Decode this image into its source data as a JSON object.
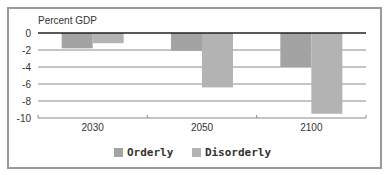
{
  "chart_data": {
    "type": "bar",
    "title": "",
    "ylabel": "Percent GDP",
    "xlabel": "",
    "categories": [
      "2030",
      "2050",
      "2100"
    ],
    "series": [
      {
        "name": "Orderly",
        "values": [
          -1.8,
          -2.1,
          -4.0
        ],
        "color": "#a3a3a3"
      },
      {
        "name": "Disorderly",
        "values": [
          -1.2,
          -6.4,
          -9.5
        ],
        "color": "#b3b3b3"
      }
    ],
    "ylim": [
      -10,
      0
    ],
    "yticks": [
      "0",
      "-2",
      "-4",
      "-6",
      "-8",
      "-10"
    ],
    "grid": true,
    "legend_position": "bottom"
  },
  "legend": {
    "items": [
      {
        "label": "Orderly",
        "color": "#a3a3a3"
      },
      {
        "label": "Disorderly",
        "color": "#b3b3b3"
      }
    ]
  }
}
